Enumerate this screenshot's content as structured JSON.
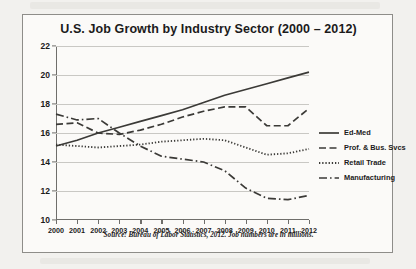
{
  "chart_data": {
    "type": "line",
    "title": "U.S. Job Growth by Industry Sector (2000 – 2012)",
    "xlabel": "",
    "ylabel": "",
    "x": [
      2000,
      2001,
      2002,
      2003,
      2004,
      2005,
      2006,
      2007,
      2008,
      2009,
      2010,
      2011,
      2012
    ],
    "xtick_labels": [
      "2000",
      "2001",
      "2002",
      "2003",
      "2004",
      "2005",
      "2006",
      "2007",
      "2008",
      "2009",
      "2010",
      "2011",
      "2012"
    ],
    "ytick_labels": [
      "10",
      "12",
      "14",
      "16",
      "18",
      "20",
      "22"
    ],
    "yticks": [
      10,
      12,
      14,
      16,
      18,
      20,
      22
    ],
    "ylim": [
      10,
      22
    ],
    "xlim": [
      2000,
      2012
    ],
    "grid": "horizontal",
    "legend_position": "right",
    "series": [
      {
        "name": "Ed-Med",
        "style": "solid",
        "color": "#3b3a37",
        "values": [
          15.1,
          15.5,
          16.0,
          16.4,
          16.8,
          17.2,
          17.6,
          18.1,
          18.6,
          19.0,
          19.4,
          19.8,
          20.2
        ]
      },
      {
        "name": "Prof. & Bus. Svcs",
        "style": "dashed",
        "color": "#3b3a37",
        "values": [
          16.6,
          16.7,
          16.0,
          15.9,
          16.2,
          16.6,
          17.1,
          17.5,
          17.8,
          17.8,
          16.5,
          16.5,
          17.7
        ]
      },
      {
        "name": "Retail Trade",
        "style": "dotted",
        "color": "#3b3a37",
        "values": [
          15.2,
          15.1,
          15.0,
          15.1,
          15.2,
          15.4,
          15.5,
          15.6,
          15.5,
          15.0,
          14.5,
          14.6,
          14.9
        ]
      },
      {
        "name": "Manufacturing",
        "style": "dashdot",
        "color": "#3b3a37",
        "values": [
          17.3,
          16.9,
          17.0,
          16.0,
          15.1,
          14.4,
          14.2,
          14.0,
          13.4,
          12.2,
          11.5,
          11.4,
          11.7
        ]
      }
    ],
    "source_note": "Source: Bureau of Labor Statistics, 2012.  Job numbers are in millions."
  }
}
